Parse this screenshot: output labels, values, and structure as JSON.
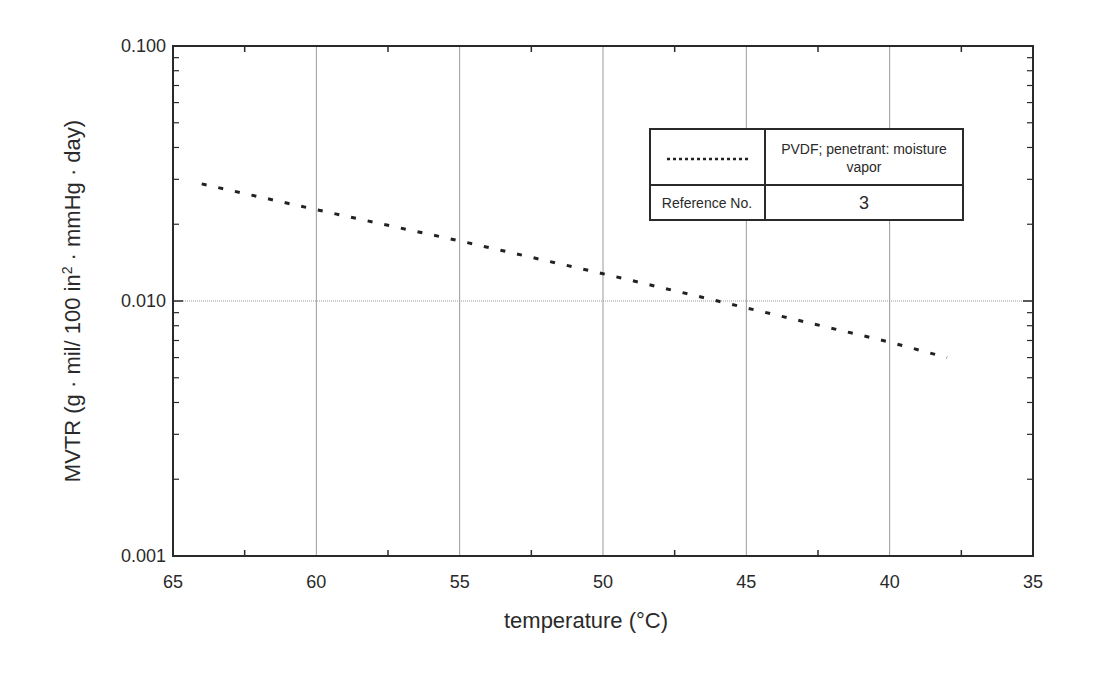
{
  "chart_data": {
    "type": "line",
    "title": "",
    "xlabel": "temperature (°C)",
    "ylabel": "MVTR (g · mil/ 100 in² · mmHg · day)",
    "ylabel_parts": {
      "before": "MVTR (g · mil/ 100 in",
      "sup": "2",
      "after": " · mmHg · day)"
    },
    "xlim": [
      65,
      35
    ],
    "x_reversed": true,
    "ylim": [
      0.001,
      0.1
    ],
    "yscale": "log",
    "grid": true,
    "x_ticks": [
      65,
      60,
      55,
      50,
      45,
      40,
      35
    ],
    "x_tick_labels": [
      "65",
      "60",
      "55",
      "50",
      "45",
      "40",
      "35"
    ],
    "y_ticks": [
      0.001,
      0.01,
      0.1
    ],
    "y_tick_labels": [
      "0.001",
      "0.010",
      "0.100"
    ],
    "series": [
      {
        "name": "PVDF; penetrant: moisture vapor",
        "style": "dotted",
        "color": "#222222",
        "x": [
          64,
          60,
          55,
          50,
          46,
          45,
          40,
          38
        ],
        "y": [
          0.0288,
          0.0228,
          0.0172,
          0.0128,
          0.01,
          0.0094,
          0.0069,
          0.006
        ]
      }
    ],
    "legend": {
      "position": "upper right",
      "series_label_line1": "PVDF; penetrant: moisture",
      "series_label_line2": "vapor",
      "reference_label": "Reference No.",
      "reference_value": "3"
    }
  }
}
